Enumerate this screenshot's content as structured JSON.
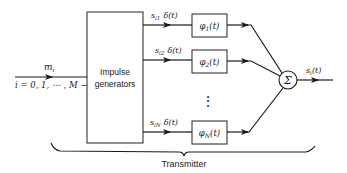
{
  "diagram": {
    "input": {
      "symbol": "m",
      "symbol_sub": "i",
      "range_label": "i = 0, 1, ⋯ , M − 1"
    },
    "impulse_block": {
      "line1": "Impulse",
      "line2": "generators"
    },
    "branches": [
      {
        "coef": "s",
        "coef_sub": "i1",
        "impulse": "δ(t)",
        "filter": "φ",
        "filter_sub": "1",
        "filter_arg": "(t)"
      },
      {
        "coef": "s",
        "coef_sub": "i2",
        "impulse": "δ(t)",
        "filter": "φ",
        "filter_sub": "2",
        "filter_arg": "(t)"
      },
      {
        "coef": "s",
        "coef_sub": "iN",
        "impulse": "δ(t)",
        "filter": "φ",
        "filter_sub": "N",
        "filter_arg": "(t)"
      }
    ],
    "ellipsis": "⋮",
    "summer": {
      "symbol": "Σ"
    },
    "output": {
      "symbol": "s",
      "symbol_sub": "i",
      "arg": "(t)"
    },
    "group_label": "Transmitter"
  }
}
